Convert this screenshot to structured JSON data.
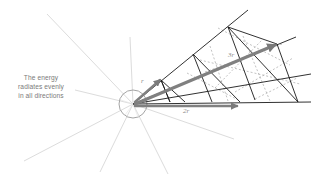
{
  "caption": {
    "lines": [
      "The energy",
      "radiates evenly",
      "in all directions"
    ]
  },
  "labels": {
    "r": "r",
    "two_r": "2r",
    "three_r": "3r"
  },
  "colors": {
    "rays": "#d9d9d9",
    "grid": "#1a1a1a",
    "arrow": "#808080",
    "dashed": "#a8a8a8",
    "text": "#7a7a7a"
  },
  "source": {
    "center": [
      133,
      104
    ],
    "radius": 13
  }
}
